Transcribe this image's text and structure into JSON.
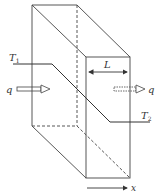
{
  "diagram": {
    "type": "heat-conduction-slab",
    "labels": {
      "T1": "T",
      "T1_sub": "1",
      "T2": "T",
      "T2_sub": "2",
      "L": "L",
      "q_in": "q",
      "q_out": "q",
      "x": "x"
    },
    "colors": {
      "line": "#333333",
      "background": "#ffffff"
    }
  }
}
